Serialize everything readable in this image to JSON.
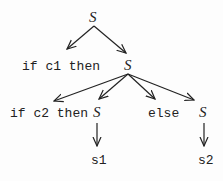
{
  "diagram": {
    "type": "parse-tree",
    "nodes": {
      "root": {
        "label": "S"
      },
      "if_c1_then": {
        "label": "if c1 then"
      },
      "s_inner": {
        "label": "S"
      },
      "if_c2_then": {
        "label": "if c2 then"
      },
      "s_then": {
        "label": "S"
      },
      "else": {
        "label": "else"
      },
      "s_else": {
        "label": "S"
      },
      "s1": {
        "label": "s1"
      },
      "s2": {
        "label": "s2"
      }
    },
    "edges": [
      {
        "from": "root",
        "to": "if_c1_then"
      },
      {
        "from": "root",
        "to": "s_inner"
      },
      {
        "from": "s_inner",
        "to": "if_c2_then"
      },
      {
        "from": "s_inner",
        "to": "s_then"
      },
      {
        "from": "s_inner",
        "to": "else"
      },
      {
        "from": "s_inner",
        "to": "s_else"
      },
      {
        "from": "s_then",
        "to": "s1"
      },
      {
        "from": "s_else",
        "to": "s2"
      }
    ]
  }
}
